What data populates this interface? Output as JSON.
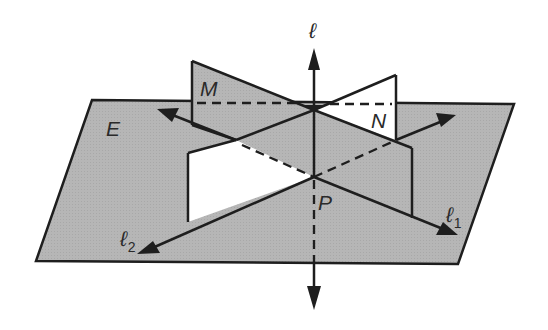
{
  "figure": {
    "colors": {
      "plane_fill": "#b4b4b4",
      "light_fill": "#ffffff",
      "stroke": "#1e1e1e"
    }
  },
  "labels": {
    "line_l": "ℓ",
    "plane_M": "M",
    "plane_N": "N",
    "plane_E": "E",
    "point_P": "P",
    "line_l1_base": "ℓ",
    "line_l1_sub": "1",
    "line_l2_base": "ℓ",
    "line_l2_sub": "2"
  }
}
